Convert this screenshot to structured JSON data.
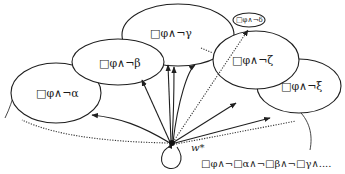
{
  "diagram": {
    "type": "modal-logic-worlds",
    "colors": {
      "stroke": "#1f1f1f",
      "background": "#ffffff",
      "text": "#1a1a1a"
    },
    "center_world": {
      "label": "w*"
    },
    "worlds": [
      {
        "id": "alpha",
        "label": "□φ∧¬α"
      },
      {
        "id": "beta",
        "label": "□φ∧¬β"
      },
      {
        "id": "gamma",
        "label": "□φ∧¬γ"
      },
      {
        "id": "delta",
        "label": "□φ∧¬δ"
      },
      {
        "id": "zeta",
        "label": "□φ∧¬ζ"
      },
      {
        "id": "xi",
        "label": "□φ∧¬ξ"
      }
    ],
    "bottom_formula": "□φ∧¬□α∧¬□β∧¬□γ∧...."
  }
}
